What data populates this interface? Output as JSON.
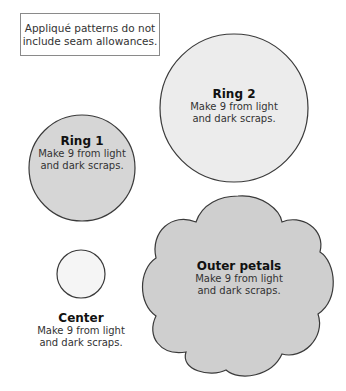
{
  "note": {
    "line1": "Appliqué patterns do not",
    "line2": "include seam allowances."
  },
  "colors": {
    "ring2_fill": "#ececec",
    "ring1_fill": "#d6d6d6",
    "center_fill": "#f5f5f5",
    "petals_fill": "#cfcfcf",
    "stroke": "#3a3a3a"
  },
  "shapes": {
    "ring2": {
      "title": "Ring 2",
      "line1": "Make 9 from light",
      "line2": "and dark scraps."
    },
    "ring1": {
      "title": "Ring 1",
      "line1": "Make 9 from light",
      "line2": "and dark scraps."
    },
    "center": {
      "title": "Center",
      "line1": "Make 9 from light",
      "line2": "and dark scraps."
    },
    "outer_petals": {
      "title": "Outer petals",
      "line1": "Make 9 from light",
      "line2": "and dark scraps."
    }
  }
}
